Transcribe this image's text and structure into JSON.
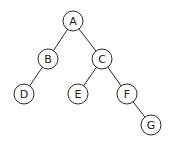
{
  "diagram": {
    "type": "binary-tree",
    "nodes": [
      {
        "id": "A",
        "label": "A",
        "x": 73,
        "y": 21
      },
      {
        "id": "B",
        "label": "B",
        "x": 48,
        "y": 59
      },
      {
        "id": "C",
        "label": "C",
        "x": 102,
        "y": 59
      },
      {
        "id": "D",
        "label": "D",
        "x": 24,
        "y": 94
      },
      {
        "id": "E",
        "label": "E",
        "x": 78,
        "y": 94
      },
      {
        "id": "F",
        "label": "F",
        "x": 127,
        "y": 94
      },
      {
        "id": "G",
        "label": "G",
        "x": 151,
        "y": 125
      }
    ],
    "edges": [
      {
        "from": "A",
        "to": "B"
      },
      {
        "from": "A",
        "to": "C"
      },
      {
        "from": "B",
        "to": "D"
      },
      {
        "from": "C",
        "to": "E"
      },
      {
        "from": "C",
        "to": "F"
      },
      {
        "from": "F",
        "to": "G"
      }
    ],
    "node_radius": 10
  }
}
